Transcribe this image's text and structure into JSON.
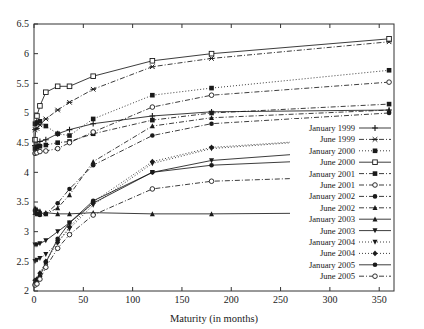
{
  "chart_data": {
    "type": "line",
    "title": "",
    "xlabel": "Maturity (in months)",
    "ylabel": "",
    "xlim": [
      0,
      365
    ],
    "ylim": [
      2,
      6.5
    ],
    "xticks": [
      0,
      50,
      100,
      150,
      200,
      250,
      300,
      350
    ],
    "yticks": [
      2,
      2.5,
      3,
      3.5,
      4,
      4.5,
      5,
      5.5,
      6,
      6.5
    ],
    "xtick_labels": [
      "0",
      "50",
      "100",
      "150",
      "200",
      "250",
      "300",
      "350"
    ],
    "ytick_labels": [
      "2",
      "2.5",
      "3",
      "3.5",
      "4",
      "4.5",
      "5",
      "5.5",
      "6",
      "6.5"
    ],
    "grid": false,
    "legend_position": "right-center",
    "x": [
      1,
      3,
      6,
      12,
      24,
      36,
      60,
      120,
      180,
      360
    ],
    "series": [
      {
        "name": "January 1999",
        "marker": "plus",
        "dash": "solid",
        "values": [
          4.45,
          4.46,
          4.52,
          4.55,
          4.65,
          4.72,
          4.82,
          4.95,
          5.02,
          5.05
        ]
      },
      {
        "name": "June 1999",
        "marker": "star",
        "dash": "dashdot",
        "values": [
          4.72,
          4.74,
          4.8,
          4.9,
          5.05,
          5.18,
          5.4,
          5.78,
          5.92,
          6.2
        ]
      },
      {
        "name": "January 2000",
        "marker": "filled-square",
        "dash": "dotted",
        "values": [
          4.82,
          4.84,
          4.86,
          4.78,
          4.65,
          4.62,
          4.9,
          5.3,
          5.42,
          5.72
        ]
      },
      {
        "name": "June 2000",
        "marker": "open-square",
        "dash": "solid",
        "values": [
          4.55,
          4.95,
          5.12,
          5.35,
          5.45,
          5.45,
          5.62,
          5.88,
          6.0,
          6.25
        ]
      },
      {
        "name": "January 2001",
        "marker": "filled-square",
        "dash": "dashdot",
        "values": [
          4.4,
          4.42,
          4.44,
          4.46,
          4.5,
          4.52,
          4.65,
          4.88,
          5.0,
          5.15
        ]
      },
      {
        "name": "June 2001",
        "marker": "open-circle",
        "dash": "dashdot",
        "values": [
          4.32,
          4.33,
          4.35,
          4.36,
          4.4,
          4.5,
          4.68,
          5.1,
          5.3,
          5.52
        ]
      },
      {
        "name": "January 2002",
        "marker": "filled-circle",
        "dash": "dashdot",
        "values": [
          3.35,
          3.3,
          3.28,
          3.3,
          3.48,
          3.72,
          4.12,
          4.62,
          4.82,
          5.0
        ]
      },
      {
        "name": "June 2002",
        "marker": "triangle",
        "dash": "dashdot",
        "values": [
          3.4,
          3.38,
          3.35,
          3.3,
          3.4,
          3.62,
          4.18,
          4.78,
          4.92,
          5.05
        ]
      },
      {
        "name": "January 2003",
        "marker": "triangle",
        "dash": "solid",
        "values": [
          3.32,
          3.3,
          3.3,
          3.32,
          3.3,
          3.3,
          3.32,
          3.3,
          3.3,
          3.32
        ]
      },
      {
        "name": "June 2003",
        "marker": "down-triangle",
        "dash": "solid",
        "values": [
          2.78,
          2.78,
          2.8,
          2.85,
          3.0,
          3.15,
          3.48,
          4.0,
          4.2,
          4.42
        ]
      },
      {
        "name": "January 2004",
        "marker": "down-triangle",
        "dash": "dotted",
        "values": [
          2.5,
          2.52,
          2.55,
          2.62,
          2.82,
          3.05,
          3.45,
          4.15,
          4.4,
          4.62
        ]
      },
      {
        "name": "June 2004",
        "marker": "diamond",
        "dash": "dotted",
        "values": [
          2.18,
          2.2,
          2.3,
          2.5,
          2.82,
          3.08,
          3.5,
          4.18,
          4.42,
          4.62
        ]
      },
      {
        "name": "January 2005",
        "marker": "filled-circle",
        "dash": "solid",
        "values": [
          2.12,
          2.15,
          2.25,
          2.48,
          2.88,
          3.15,
          3.52,
          4.0,
          4.12,
          4.25
        ]
      },
      {
        "name": "June 2005",
        "marker": "open-circle",
        "dash": "dashdot",
        "values": [
          2.1,
          2.12,
          2.2,
          2.4,
          2.72,
          2.95,
          3.28,
          3.72,
          3.85,
          3.95
        ]
      }
    ]
  }
}
